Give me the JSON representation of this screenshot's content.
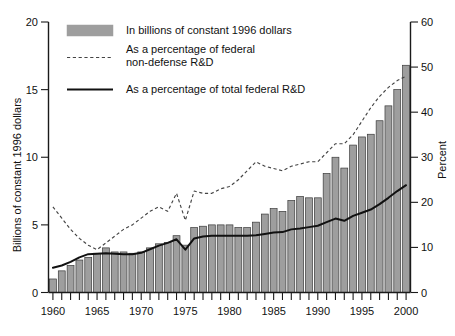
{
  "chart_data": {
    "type": "bar",
    "title": "",
    "subtitle": "",
    "xlabel": "",
    "ylabel": "Billions of constant 1996 dollars",
    "y2label": "Percent",
    "grid": false,
    "legend_position": "top-center",
    "xlim": [
      1959.4,
      2000.6
    ],
    "ylim": [
      0,
      20
    ],
    "y2lim": [
      0,
      60
    ],
    "yticks": [
      0,
      5,
      10,
      15,
      20
    ],
    "y2ticks": [
      0,
      10,
      20,
      30,
      40,
      50,
      60
    ],
    "xticks_major": [
      1960,
      1965,
      1970,
      1975,
      1980,
      1985,
      1990,
      1995,
      2000
    ],
    "xtick_interval_minor": 1,
    "categories": [
      1960,
      1961,
      1962,
      1963,
      1964,
      1965,
      1966,
      1967,
      1968,
      1969,
      1970,
      1971,
      1972,
      1973,
      1974,
      1975,
      1976,
      1977,
      1978,
      1979,
      1980,
      1981,
      1982,
      1983,
      1984,
      1985,
      1986,
      1987,
      1988,
      1989,
      1990,
      1991,
      1992,
      1993,
      1994,
      1995,
      1996,
      1997,
      1998,
      1999,
      2000
    ],
    "series": [
      {
        "name": "In billions of constant 1996 dollars",
        "type": "bar",
        "axis": "left",
        "unit": "billions of constant 1996 dollars",
        "color": "#9e9e9e",
        "values": [
          1.0,
          1.6,
          2.0,
          2.4,
          2.6,
          2.9,
          3.3,
          3.0,
          3.0,
          2.9,
          3.0,
          3.3,
          3.6,
          3.7,
          4.2,
          3.5,
          4.8,
          4.9,
          5.0,
          5.0,
          5.0,
          4.8,
          4.8,
          5.2,
          5.8,
          6.2,
          6.0,
          6.8,
          7.1,
          7.0,
          7.0,
          8.8,
          10.0,
          9.2,
          10.9,
          11.5,
          11.7,
          12.7,
          13.8,
          15.0,
          16.8
        ]
      },
      {
        "name": "As a percentage of federal non-defense R&D",
        "type": "line",
        "style": "dashed",
        "axis": "right",
        "unit": "percent",
        "color": "#444444",
        "values": [
          19.0,
          16.5,
          14.0,
          12.0,
          10.5,
          9.5,
          11.0,
          12.5,
          14.0,
          15.0,
          16.5,
          18.0,
          19.0,
          18.0,
          22.0,
          16.0,
          22.5,
          22.0,
          22.0,
          23.0,
          23.5,
          25.0,
          27.0,
          29.0,
          28.0,
          27.5,
          27.0,
          28.0,
          28.5,
          29.0,
          29.0,
          31.0,
          33.0,
          33.0,
          35.0,
          38.0,
          41.0,
          43.5,
          45.5,
          47.0,
          48.0
        ]
      },
      {
        "name": "As a percentage of total federal R&D",
        "type": "line",
        "style": "solid",
        "axis": "right",
        "unit": "percent",
        "color": "#111111",
        "values": [
          5.5,
          6.0,
          6.8,
          7.8,
          8.5,
          8.6,
          8.7,
          8.6,
          8.5,
          8.5,
          8.8,
          9.6,
          10.4,
          11.0,
          11.8,
          9.5,
          12.0,
          12.4,
          12.6,
          12.6,
          12.6,
          12.6,
          12.6,
          12.7,
          13.0,
          13.3,
          13.4,
          14.0,
          14.2,
          14.5,
          14.8,
          15.6,
          16.4,
          15.9,
          17.0,
          17.7,
          18.4,
          19.6,
          21.0,
          22.5,
          23.8
        ]
      }
    ],
    "legend": [
      {
        "label": "In billions of constant 1996 dollars",
        "marker": "bar-swatch"
      },
      {
        "label_line1": "As a percentage of federal",
        "label_line2": "non-defense R&D",
        "marker": "dashed-line"
      },
      {
        "label": "As a percentage of total federal R&D",
        "marker": "solid-line"
      }
    ]
  },
  "axes": {
    "left_title": "Billions of constant 1996 dollars",
    "right_title": "Percent",
    "left_ticks": [
      "0",
      "5",
      "10",
      "15",
      "20"
    ],
    "right_ticks": [
      "0",
      "10",
      "20",
      "30",
      "40",
      "50",
      "60"
    ],
    "x_ticks": [
      "1960",
      "1965",
      "1970",
      "1975",
      "1980",
      "1985",
      "1990",
      "1995",
      "2000"
    ]
  },
  "legend": {
    "item1": "In billions of constant 1996 dollars",
    "item2_line1": "As a percentage of federal",
    "item2_line2": "non-defense R&D",
    "item3": "As a percentage of total federal R&D"
  },
  "colors": {
    "bar_fill": "#9e9e9e",
    "bar_stroke": "#3a3a3a",
    "solid_line": "#111111",
    "dashed_line": "#444444",
    "axis": "#1a1a1a",
    "background": "#ffffff"
  }
}
